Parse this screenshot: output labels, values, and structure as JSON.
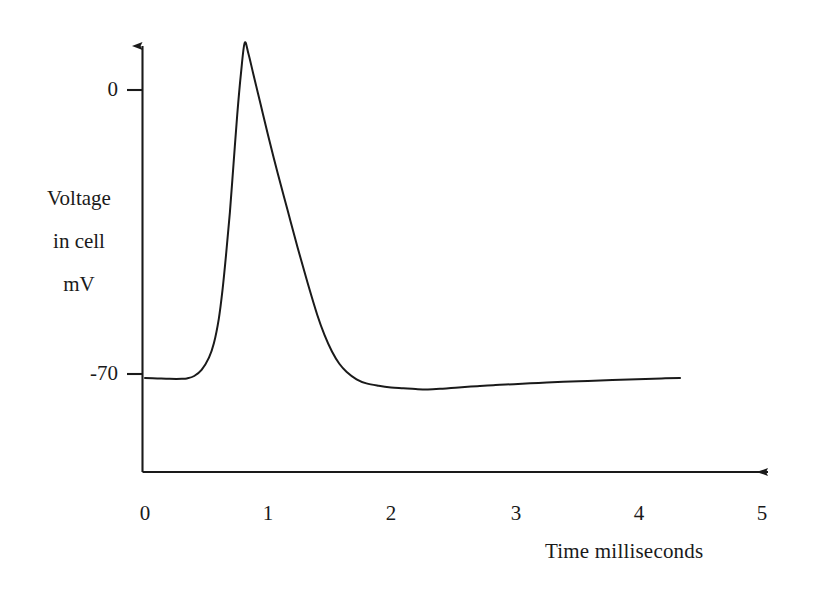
{
  "chart_data": {
    "type": "line",
    "title": "",
    "subtitle": "",
    "xlabel": "Time  milliseconds",
    "ylabel_lines": [
      "Voltage",
      "in cell",
      "mV"
    ],
    "ylabel": "Voltage in cell mV",
    "xlim": [
      0,
      5
    ],
    "ylim": [
      -140,
      20
    ],
    "xticks": [
      "0",
      "1",
      "2",
      "3",
      "4",
      "5"
    ],
    "xtick_values": [
      0,
      1,
      2,
      3,
      4,
      5
    ],
    "yticks": [
      "0",
      "-70"
    ],
    "ytick_values": [
      0,
      -70
    ],
    "grid": false,
    "legend": false,
    "legend_position": "none",
    "axis_style": "arrows",
    "line_color": "#1a1a1a",
    "line_width": 2,
    "background_color": "#ffffff",
    "annotations": [],
    "series": [
      {
        "name": "Membrane potential",
        "units": "mV",
        "x": [
          0.0,
          0.1,
          0.2,
          0.3,
          0.34,
          0.4,
          0.46,
          0.52,
          0.56,
          0.6,
          0.63,
          0.66,
          0.69,
          0.72,
          0.75,
          0.78,
          0.81,
          0.84,
          0.88,
          0.94,
          1.0,
          1.08,
          1.16,
          1.24,
          1.32,
          1.4,
          1.46,
          1.52,
          1.58,
          1.64,
          1.72,
          1.8,
          1.9,
          2.0,
          2.1,
          2.2,
          2.3,
          2.42,
          2.55,
          2.7,
          2.85,
          3.0,
          3.2,
          3.4,
          3.6,
          3.8,
          4.0,
          4.2,
          4.35
        ],
        "y": [
          -70.5,
          -70.6,
          -70.7,
          -70.7,
          -70.6,
          -70.0,
          -68.5,
          -65.5,
          -62.0,
          -56.0,
          -49.0,
          -40.0,
          -30.0,
          -18.0,
          -6.0,
          4.0,
          11.5,
          9.0,
          4.0,
          -3.5,
          -11.0,
          -20.5,
          -29.5,
          -38.5,
          -47.0,
          -55.0,
          -60.0,
          -64.0,
          -67.0,
          -69.0,
          -70.8,
          -71.8,
          -72.4,
          -72.8,
          -73.0,
          -73.2,
          -73.3,
          -73.1,
          -72.8,
          -72.5,
          -72.2,
          -72.0,
          -71.7,
          -71.4,
          -71.2,
          -71.0,
          -70.8,
          -70.6,
          -70.5
        ],
        "key_points": {
          "resting_potential": -70,
          "peak_voltage": 11.5,
          "peak_time": 0.81,
          "threshold_time": 0.46,
          "hyperpolarization_min": -73.3,
          "hyperpolarization_time": 2.3,
          "trace_end_time": 4.35
        }
      }
    ]
  },
  "axes": {
    "y_tick_top_label": "0",
    "y_tick_bottom_label": "-70",
    "x_tick_labels": [
      "0",
      "1",
      "2",
      "3",
      "4",
      "5"
    ],
    "y_title_line1": "Voltage",
    "y_title_line2": "in cell",
    "y_title_line3": "mV",
    "x_title": "Time  milliseconds"
  }
}
